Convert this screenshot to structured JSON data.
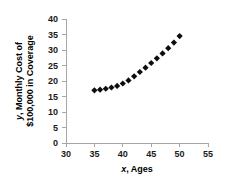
{
  "chart_data": {
    "type": "scatter",
    "title": "",
    "xlabel": "x, Ages",
    "xlabel_italic_part": "x",
    "xlabel_rest": ", Ages",
    "ylabel": "y, Monthly Cost of $100,000 in Coverage",
    "ylabel_line1_italic": "y",
    "ylabel_line1_rest": ", Monthly Cost of",
    "ylabel_line2": "$100,000 in Coverage",
    "xlim": [
      30,
      55
    ],
    "ylim": [
      0,
      40
    ],
    "xticks": [
      30,
      35,
      40,
      45,
      50,
      55
    ],
    "yticks": [
      0,
      5,
      10,
      15,
      20,
      25,
      30,
      35,
      40
    ],
    "grid": false,
    "legend": false,
    "marker_shape": "diamond",
    "marker_color": "#0d0d0d",
    "x": [
      35,
      36,
      37,
      38,
      39,
      40,
      41,
      42,
      43,
      44,
      45,
      46,
      47,
      48,
      49,
      50
    ],
    "y": [
      17.0,
      17.2,
      17.5,
      17.9,
      18.4,
      19.2,
      20.2,
      21.5,
      22.9,
      24.3,
      25.8,
      27.3,
      28.9,
      30.6,
      32.4,
      34.5
    ],
    "series": [
      {
        "name": "Monthly Cost",
        "points": [
          {
            "x": 35,
            "y": 17.0
          },
          {
            "x": 36,
            "y": 17.2
          },
          {
            "x": 37,
            "y": 17.5
          },
          {
            "x": 38,
            "y": 17.9
          },
          {
            "x": 39,
            "y": 18.4
          },
          {
            "x": 40,
            "y": 19.2
          },
          {
            "x": 41,
            "y": 20.2
          },
          {
            "x": 42,
            "y": 21.5
          },
          {
            "x": 43,
            "y": 22.9
          },
          {
            "x": 44,
            "y": 24.3
          },
          {
            "x": 45,
            "y": 25.8
          },
          {
            "x": 46,
            "y": 27.3
          },
          {
            "x": 47,
            "y": 28.9
          },
          {
            "x": 48,
            "y": 30.6
          },
          {
            "x": 49,
            "y": 32.4
          },
          {
            "x": 50,
            "y": 34.5
          }
        ]
      }
    ]
  },
  "axis": {
    "x_tick_labels": [
      "30",
      "35",
      "40",
      "45",
      "50",
      "55"
    ],
    "y_tick_labels": [
      "0",
      "5",
      "10",
      "15",
      "20",
      "25",
      "30",
      "35",
      "40"
    ]
  }
}
